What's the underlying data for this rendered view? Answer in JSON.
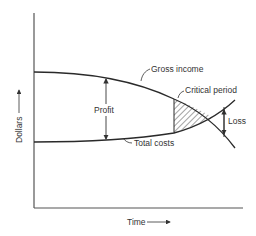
{
  "diagram": {
    "type": "profit-cost-curves",
    "axes": {
      "x_label": "Time",
      "y_label": "Dollars"
    },
    "curves": [
      {
        "name": "gross-income",
        "label": "Gross income"
      },
      {
        "name": "total-costs",
        "label": "Total costs"
      }
    ],
    "annotations": {
      "profit": "Profit",
      "critical_period": "Critical period",
      "loss": "Loss"
    },
    "colors": {
      "line": "#2a2a2a",
      "axis": "#555555",
      "text": "#333333"
    }
  }
}
